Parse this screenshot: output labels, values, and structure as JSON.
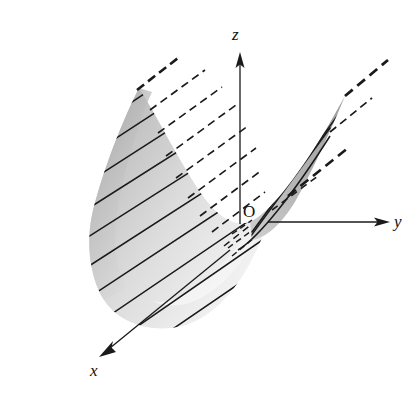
{
  "figure": {
    "kind": "3d-ruled-surface-diagram",
    "title": "",
    "background_color": "#ffffff",
    "width": 420,
    "height": 400
  },
  "axes": {
    "origin_label": "O",
    "origin_point": {
      "x": 250,
      "y": 222
    },
    "items": [
      {
        "name": "z",
        "label": "z",
        "direction": "up",
        "line": {
          "x1": 240,
          "y1": 222,
          "x2": 240,
          "y2": 60
        },
        "arrow_tip": {
          "x": 240,
          "y": 53
        },
        "label_pos": {
          "x": 238,
          "y": 35
        },
        "color": "#1a1a1a"
      },
      {
        "name": "y",
        "label": "y",
        "direction": "right",
        "line": {
          "x1": 268,
          "y1": 222,
          "x2": 380,
          "y2": 222
        },
        "arrow_tip": {
          "x": 390,
          "y": 222
        },
        "label_pos": {
          "x": 399,
          "y": 222
        },
        "color": "#1a1a1a"
      },
      {
        "name": "x",
        "label": "x",
        "direction": "down-left (toward viewer)",
        "line": {
          "x1": 228,
          "y1": 252,
          "x2": 108,
          "y2": 350
        },
        "arrow_tip": {
          "x": 99,
          "y": 357
        },
        "label_pos": {
          "x": 96,
          "y": 372
        },
        "color": "#1a1a1a"
      }
    ]
  },
  "surface": {
    "description": "Ruled saddle surface with two wings meeting at the origin",
    "shade_light": "#f2f2f2",
    "shade_mid": "#d4d4d4",
    "shade_dark": "#9a9a9a",
    "ruling_color": "#1a1a1a",
    "hidden_ruling_style": "dashed",
    "visible_ruling_style": "solid",
    "wings": [
      {
        "name": "left-wing",
        "position": "left of z-axis, large curved sheet",
        "ruling_count": 11,
        "has_dashed_extension": true
      },
      {
        "name": "right-wing",
        "position": "right of z-axis, narrow sliver rising to upper right",
        "ruling_count": 1,
        "has_dashed_extension": true
      }
    ]
  }
}
